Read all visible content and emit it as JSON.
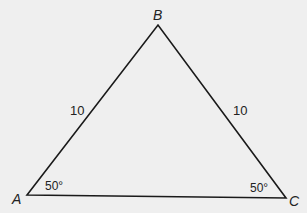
{
  "diagram": {
    "type": "triangle",
    "vertices": {
      "A": {
        "label": "A"
      },
      "B": {
        "label": "B"
      },
      "C": {
        "label": "C"
      }
    },
    "sides": {
      "AB": {
        "label": "10"
      },
      "BC": {
        "label": "10"
      }
    },
    "angles": {
      "A": {
        "label": "50°"
      },
      "C": {
        "label": "50°"
      }
    },
    "colors": {
      "stroke": "#1a1a1a",
      "background": "#efefef"
    }
  }
}
